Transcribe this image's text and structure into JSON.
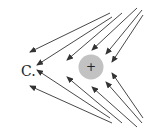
{
  "option_label": "C.",
  "charge": {
    "sign": "+",
    "cx": 91,
    "cy": 67,
    "r": 12.5,
    "fill": "#c2c2c2"
  },
  "arrow_color": "#333333",
  "field_lines": [
    {
      "x1": 110,
      "y1": 13,
      "x2": 30,
      "y2": 52
    },
    {
      "x1": 112,
      "y1": 17,
      "x2": 37,
      "y2": 65
    },
    {
      "x1": 122,
      "y1": 13,
      "x2": 67,
      "y2": 60
    },
    {
      "x1": 137,
      "y1": 8,
      "x2": 92,
      "y2": 50
    },
    {
      "x1": 142,
      "y1": 10,
      "x2": 106,
      "y2": 54
    },
    {
      "x1": 143,
      "y1": 15,
      "x2": 112,
      "y2": 62
    },
    {
      "x1": 112,
      "y1": 123,
      "x2": 30,
      "y2": 86
    },
    {
      "x1": 110,
      "y1": 118,
      "x2": 37,
      "y2": 70
    },
    {
      "x1": 122,
      "y1": 123,
      "x2": 67,
      "y2": 77
    },
    {
      "x1": 137,
      "y1": 127,
      "x2": 92,
      "y2": 87
    },
    {
      "x1": 142,
      "y1": 123,
      "x2": 106,
      "y2": 82
    },
    {
      "x1": 143,
      "y1": 118,
      "x2": 112,
      "y2": 73
    }
  ]
}
